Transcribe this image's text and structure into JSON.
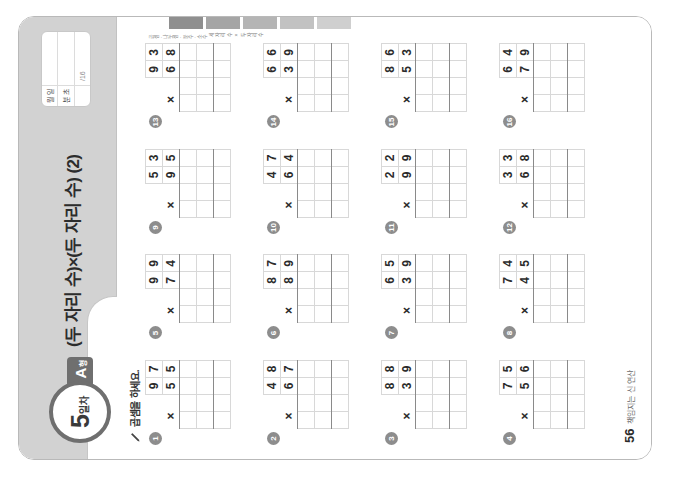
{
  "document": {
    "type": "math-worksheet",
    "language": "ko",
    "orientation_note": "portrait page displayed rotated 90 degrees counter-clockwise"
  },
  "header": {
    "day_number": "5",
    "day_unit": "일차",
    "type_letter": "A",
    "type_suffix": "형",
    "title": "(두 자리 수)×(두 자리 수) (2)",
    "info_box": {
      "rows": [
        {
          "label": "월 일",
          "value": ""
        },
        {
          "label": "분 초",
          "value": ""
        },
        {
          "label": "",
          "value": "/16"
        }
      ],
      "label_month_day": "월  일",
      "label_min_sec": "분  초",
      "score_total": "/16"
    }
  },
  "instruction": {
    "icon": "pencil-icon",
    "text": "곱셈을 하세요."
  },
  "problems": [
    {
      "num": "1",
      "multiplicand": "97",
      "multiplier": "55",
      "operator": "×"
    },
    {
      "num": "5",
      "multiplicand": "99",
      "multiplier": "74",
      "operator": "×"
    },
    {
      "num": "9",
      "multiplicand": "53",
      "multiplier": "95",
      "operator": "×"
    },
    {
      "num": "13",
      "multiplicand": "93",
      "multiplier": "68",
      "operator": "×"
    },
    {
      "num": "2",
      "multiplicand": "48",
      "multiplier": "67",
      "operator": "×"
    },
    {
      "num": "6",
      "multiplicand": "87",
      "multiplier": "89",
      "operator": "×"
    },
    {
      "num": "10",
      "multiplicand": "47",
      "multiplier": "64",
      "operator": "×"
    },
    {
      "num": "14",
      "multiplicand": "66",
      "multiplier": "39",
      "operator": "×"
    },
    {
      "num": "3",
      "multiplicand": "88",
      "multiplier": "39",
      "operator": "×"
    },
    {
      "num": "7",
      "multiplicand": "65",
      "multiplier": "39",
      "operator": "×"
    },
    {
      "num": "11",
      "multiplicand": "22",
      "multiplier": "99",
      "operator": "×"
    },
    {
      "num": "15",
      "multiplicand": "86",
      "multiplier": "53",
      "operator": "×"
    },
    {
      "num": "4",
      "multiplicand": "75",
      "multiplier": "56",
      "operator": "×"
    },
    {
      "num": "8",
      "multiplicand": "74",
      "multiplier": "45",
      "operator": "×"
    },
    {
      "num": "12",
      "multiplicand": "33",
      "multiplier": "68",
      "operator": "×"
    },
    {
      "num": "16",
      "multiplicand": "64",
      "multiplier": "79",
      "operator": "×"
    }
  ],
  "footer": {
    "page_number": "56",
    "text": "책임지는 신 연산"
  },
  "side_strip": {
    "note": "곱셈 · 나눗셈 · 분수 · 소수",
    "label": "세 자리 수 × 두 자리 수"
  },
  "colors": {
    "header_band": "#d2d2d2",
    "badge_border": "#6f6f6f",
    "tag_background": "#6f6f6f",
    "grid_line": "#d8d8d8",
    "rule_line": "#8a8a8a",
    "text": "#2b2b2b"
  }
}
